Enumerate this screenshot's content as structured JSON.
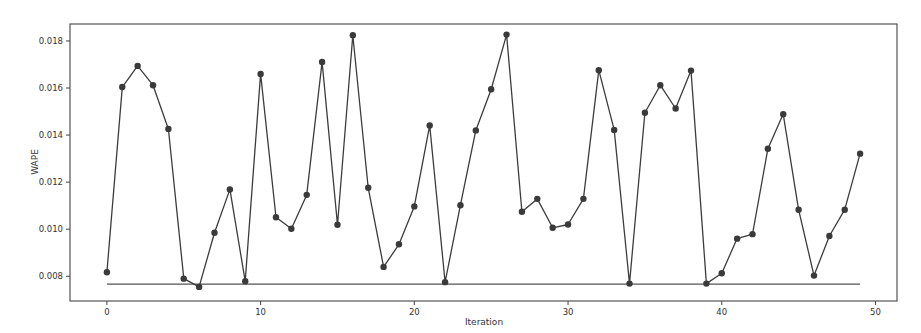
{
  "chart_data": {
    "type": "line",
    "title": "",
    "xlabel": "Iteration",
    "ylabel": "WAPE",
    "xlim": [
      -2.4,
      51.4
    ],
    "ylim": [
      0.00695,
      0.01872
    ],
    "xticks": [
      0,
      10,
      20,
      30,
      40,
      50
    ],
    "xtick_labels": [
      "0",
      "10",
      "20",
      "30",
      "40",
      "50"
    ],
    "yticks": [
      0.008,
      0.01,
      0.012,
      0.014,
      0.016,
      0.018
    ],
    "ytick_labels": [
      "0.008",
      "0.010",
      "0.012",
      "0.014",
      "0.016",
      "0.018"
    ],
    "grid": false,
    "legend": null,
    "x": [
      0,
      1,
      2,
      3,
      4,
      5,
      6,
      7,
      8,
      9,
      10,
      11,
      12,
      13,
      14,
      15,
      16,
      17,
      18,
      19,
      20,
      21,
      22,
      23,
      24,
      25,
      26,
      27,
      28,
      29,
      30,
      31,
      32,
      33,
      34,
      35,
      36,
      37,
      38,
      39,
      40,
      41,
      42,
      43,
      44,
      45,
      46,
      47,
      48,
      49
    ],
    "series": [
      {
        "name": "WAPE",
        "style": "line-with-markers",
        "color": "#3c3c3c",
        "values": [
          0.00817,
          0.01604,
          0.01694,
          0.01612,
          0.01426,
          0.0079,
          0.00755,
          0.00985,
          0.01169,
          0.00779,
          0.0166,
          0.01051,
          0.01002,
          0.01146,
          0.01711,
          0.01019,
          0.01824,
          0.01176,
          0.0084,
          0.00936,
          0.01097,
          0.01441,
          0.00775,
          0.01102,
          0.0142,
          0.01595,
          0.01827,
          0.01074,
          0.01129,
          0.01006,
          0.0102,
          0.01129,
          0.01676,
          0.01422,
          0.00769,
          0.01495,
          0.01612,
          0.01513,
          0.01674,
          0.00769,
          0.00813,
          0.0096,
          0.00979,
          0.01342,
          0.01489,
          0.01083,
          0.00803,
          0.00971,
          0.01083,
          0.01321
        ]
      },
      {
        "name": "baseline",
        "style": "flat-line",
        "color": "#555555",
        "x_range": [
          0,
          49
        ],
        "value": 0.00767
      }
    ]
  }
}
